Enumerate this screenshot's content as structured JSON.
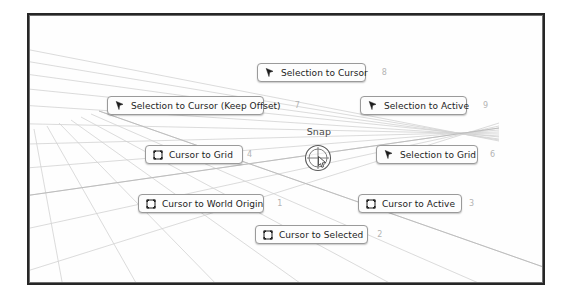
{
  "viewport": {
    "name": "3d-viewport",
    "background_color": "#fefefe",
    "grid_color": "#cfcfcf",
    "border_color": "#262626"
  },
  "pie_menu": {
    "title": "Snap",
    "center_icon": "snap-crosshair-cursor-icon",
    "items": [
      {
        "label": "Cursor to World Origin",
        "shortcut": "1",
        "icon": "cursor-3d-icon",
        "position": "bottom-left"
      },
      {
        "label": "Cursor to Selected",
        "shortcut": "2",
        "icon": "cursor-3d-icon",
        "position": "bottom"
      },
      {
        "label": "Cursor to Active",
        "shortcut": "3",
        "icon": "cursor-3d-icon",
        "position": "bottom-right"
      },
      {
        "label": "Cursor to Grid",
        "shortcut": "4",
        "icon": "cursor-3d-icon",
        "position": "left"
      },
      {
        "label": "Selection to Grid",
        "shortcut": "6",
        "icon": "selection-arrow-icon",
        "position": "right"
      },
      {
        "label": "Selection to Cursor (Keep Offset)",
        "shortcut": "7",
        "icon": "selection-arrow-icon",
        "position": "top-left"
      },
      {
        "label": "Selection to Cursor",
        "shortcut": "8",
        "icon": "selection-arrow-icon",
        "position": "top"
      },
      {
        "label": "Selection to Active",
        "shortcut": "9",
        "icon": "selection-arrow-icon",
        "position": "top-right"
      }
    ]
  }
}
